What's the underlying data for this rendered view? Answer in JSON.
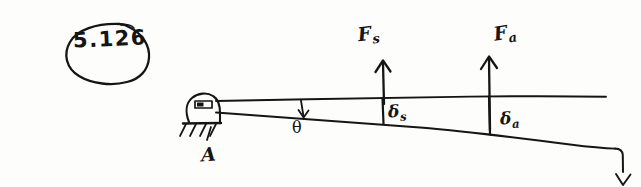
{
  "page": {
    "medium": "hand-drawn pencil sketch on white paper",
    "background_color": "#fdfdfb",
    "ink_color": "#151515",
    "width": 641,
    "height": 187
  },
  "problem": {
    "number": "5.126",
    "annotation_style": "hand-circled"
  },
  "diagram": {
    "support": {
      "label": "A",
      "type": "pin-support",
      "ground_hatching": true
    },
    "angle": {
      "label": "θ",
      "description": "angle between horizontal reference line and sloped bar"
    },
    "forces": [
      {
        "base": "F",
        "subscript": "s",
        "label": "Fs",
        "direction": "up"
      },
      {
        "base": "F",
        "subscript": "a",
        "label": "Fa",
        "direction": "up"
      }
    ],
    "deflections": [
      {
        "base": "δ",
        "subscript": "s",
        "label": "δs",
        "description": "vertical offset at the Fs station"
      },
      {
        "base": "δ",
        "subscript": "a",
        "label": "δa",
        "description": "vertical offset at the Fa station"
      }
    ],
    "end_arrow": {
      "direction": "down",
      "description": "downward arrow at the far right end of the sloped bar"
    }
  }
}
